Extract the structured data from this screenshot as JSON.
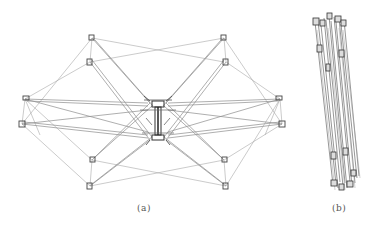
{
  "figure": {
    "panels": [
      {
        "id": "a",
        "caption": "(a)",
        "description": "Deployed configuration of the truss structure (top view)"
      },
      {
        "id": "b",
        "caption": "(b)",
        "description": "Folded / stowed configuration of the truss structure"
      }
    ]
  },
  "style": {
    "line_color": "#9a9a9a",
    "node_color": "#444444",
    "hub_color": "#333333",
    "caption_color": "#555555",
    "background": "#ffffff"
  },
  "deployed": {
    "hub": {
      "x": 158,
      "y": 103,
      "x2": 158,
      "y2": 140
    },
    "nodes": [
      {
        "name": "top-left-upper",
        "x": 92,
        "y": 38
      },
      {
        "name": "top-left-lower",
        "x": 90,
        "y": 62
      },
      {
        "name": "top-right-upper",
        "x": 224,
        "y": 38
      },
      {
        "name": "top-right-lower",
        "x": 226,
        "y": 62
      },
      {
        "name": "left-upper",
        "x": 25,
        "y": 99
      },
      {
        "name": "left-lower",
        "x": 22,
        "y": 124
      },
      {
        "name": "right-upper",
        "x": 280,
        "y": 99
      },
      {
        "name": "right-lower",
        "x": 282,
        "y": 124
      },
      {
        "name": "bottom-left-upper",
        "x": 92,
        "y": 160
      },
      {
        "name": "bottom-left-lower",
        "x": 90,
        "y": 186
      },
      {
        "name": "bottom-right-upper",
        "x": 224,
        "y": 160
      },
      {
        "name": "bottom-right-lower",
        "x": 226,
        "y": 186
      }
    ]
  }
}
